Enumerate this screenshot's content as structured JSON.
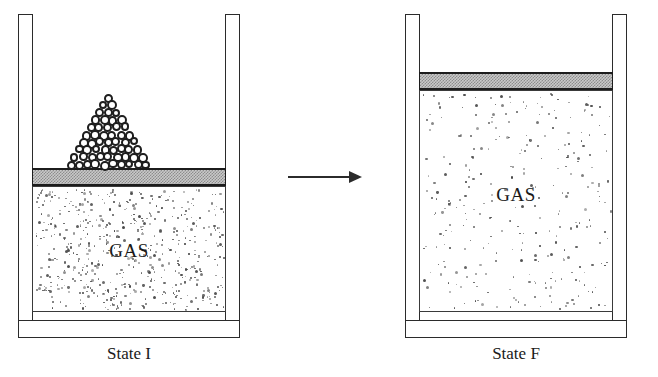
{
  "figure": {
    "type": "physics-diagram",
    "background_color": "#ffffff",
    "line_color": "#2b2b2b"
  },
  "states": [
    {
      "id": "state-i",
      "caption": "State I",
      "gas_label": "GAS",
      "has_pebble_pile": true,
      "pile_rows": 10,
      "gas_dot_count": 560,
      "piston_fill": "#c9c9c9",
      "geometry": {
        "left": 18,
        "top": 14,
        "width": 222,
        "height": 324,
        "wall_thickness": 15,
        "piston_top": 168,
        "piston_height": 18,
        "gas_top": 186,
        "gas_bottom": 312
      }
    },
    {
      "id": "state-f",
      "caption": "State F",
      "gas_label": "GAS",
      "has_pebble_pile": false,
      "pile_rows": 0,
      "gas_dot_count": 300,
      "piston_fill": "#c9c9c9",
      "geometry": {
        "left": 405,
        "top": 14,
        "width": 222,
        "height": 324,
        "wall_thickness": 15,
        "piston_top": 72,
        "piston_height": 18,
        "gas_top": 90,
        "gas_bottom": 312
      }
    }
  ],
  "arrow": {
    "name": "process-arrow",
    "direction": "right",
    "left": 288,
    "top": 171,
    "width": 74,
    "height": 12
  },
  "captions": {
    "state_i": "State I",
    "state_f": "State F"
  }
}
